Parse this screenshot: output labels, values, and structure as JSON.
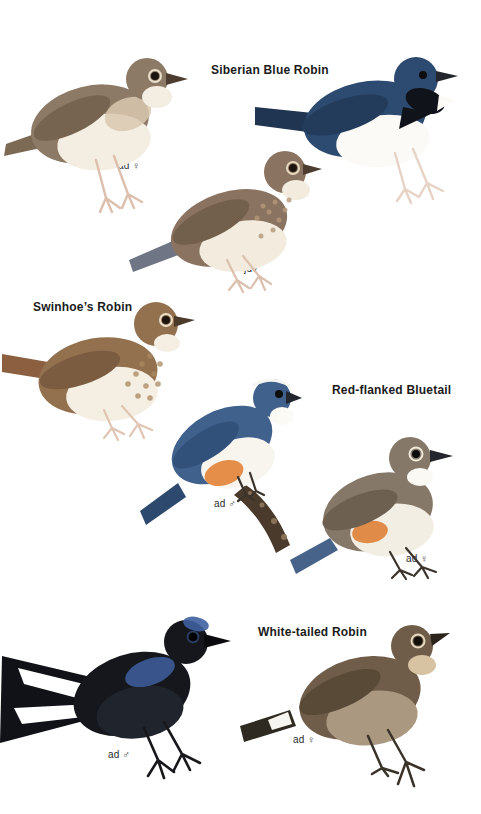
{
  "page": {
    "background": "#ffffff"
  },
  "species_titles": [
    {
      "name": "Siberian Blue Robin"
    },
    {
      "name": "Swinhoe’s Robin"
    },
    {
      "name": "Red-flanked Bluetail"
    },
    {
      "name": "White-tailed Robin"
    }
  ],
  "figures": [
    {
      "species": "Siberian Blue Robin",
      "label": "ad ♀",
      "colors": {
        "upper": "#8d7a66",
        "wing": "#776450",
        "under": "#f4eee2",
        "breast": "#d9c8b0",
        "tail": "#7d6a55",
        "legs": "#ddbfad",
        "beak": "#4c3d30",
        "eye": "#1c140e",
        "eye_ring": "#e9decb"
      }
    },
    {
      "species": "Siberian Blue Robin",
      "label": "ad ♂",
      "colors": {
        "upper": "#2d4b70",
        "wing": "#243c5c",
        "under": "#fbfaf6",
        "face": "#10141a",
        "tail": "#1f3552",
        "legs": "#e7d3c5",
        "beak": "#23262c",
        "eye": "#0c0c0c"
      }
    },
    {
      "species": "Siberian Blue Robin",
      "label": "juv",
      "colors": {
        "upper": "#8a7360",
        "wing": "#73604c",
        "under": "#f2ebde",
        "mottle": "#b49878",
        "tail": "#6f7585",
        "legs": "#dcc0ae",
        "beak": "#4c3d30",
        "eye": "#1c140e",
        "eye_ring": "#e5d7be"
      }
    },
    {
      "species": "Swinhoe’s Robin",
      "label": "ad",
      "colors": {
        "upper": "#93714f",
        "wing": "#7b5c41",
        "under": "#f5efe3",
        "mottle": "#aa885f",
        "tail": "#8d5f41",
        "legs": "#e0c5b3",
        "beak": "#4c3a2a",
        "eye": "#1c140e",
        "eye_ring": "#ecdfc9"
      }
    },
    {
      "species": "Red-flanked Bluetail",
      "label": "ad ♂",
      "colors": {
        "upper": "#40618c",
        "wing": "#31507a",
        "under": "#f8f5ee",
        "flank": "#e58e49",
        "tail": "#2d4a6e",
        "legs": "#3b342c",
        "beak": "#23262c",
        "eye": "#0e0e0e",
        "supercilium": "#f4f4f0",
        "throat": "#fbfaf5",
        "branch": "#4a3a2c",
        "branch_light": "#8a7258"
      }
    },
    {
      "species": "Red-flanked Bluetail",
      "label": "ad ♀",
      "colors": {
        "upper": "#867868",
        "wing": "#6d6050",
        "under": "#f3eee3",
        "flank": "#e08b48",
        "tail": "#47638a",
        "legs": "#3b342c",
        "beak": "#23262c",
        "eye": "#0e0e0e",
        "eye_ring": "#efe9dc",
        "throat": "#fbf9f3"
      }
    },
    {
      "species": "White-tailed Robin",
      "label": "ad ♂",
      "colors": {
        "upper": "#15171d",
        "belly": "#20242c",
        "gloss": "#3e5f9f",
        "tail": "#101217",
        "white_patch": "#ffffff",
        "legs": "#17171c",
        "beak": "#0b0b0d",
        "eye": "#000000"
      }
    },
    {
      "species": "White-tailed Robin",
      "label": "ad ♀",
      "colors": {
        "upper": "#6f5d49",
        "wing": "#594a38",
        "under": "#ab9880",
        "throat": "#d7c2a2",
        "tail": "#2e2a21",
        "white_patch": "#f7f5ef",
        "legs": "#3a332a",
        "beak": "#2b241c",
        "eye": "#140f0a",
        "eye_ring": "#e6d9bf"
      }
    }
  ]
}
